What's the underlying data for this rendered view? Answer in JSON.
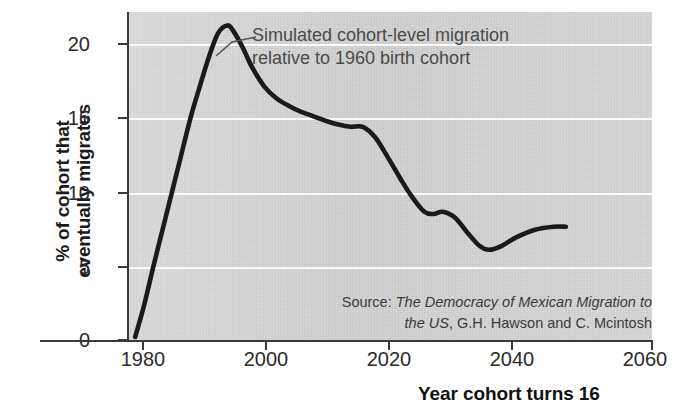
{
  "chart_data": {
    "type": "line",
    "title": "",
    "subtitle": "",
    "xlabel": "Year cohort turns 16",
    "ylabel": "% of cohort that\neventually migrates",
    "xlim": [
      1975,
      2060
    ],
    "ylim": [
      0,
      22
    ],
    "xticks": [
      "1980",
      "2000",
      "2020",
      "2040",
      "2060"
    ],
    "xtick_values": [
      1980,
      2000,
      2020,
      2040,
      2060
    ],
    "yticks": [
      "0",
      "5",
      "10",
      "15",
      "20"
    ],
    "ytick_values": [
      0,
      5,
      10,
      15,
      20
    ],
    "grid": "horizontal-white",
    "legend": "none",
    "series": [
      {
        "name": "Simulated cohort-level migration relative to 1960 birth cohort",
        "color": "#1a1a1a",
        "x": [
          1976.0,
          1977.5,
          1979.0,
          1981.0,
          1983.0,
          1985.0,
          1986.5,
          1988.0,
          1989.5,
          1991.0,
          1992.0,
          1993.5,
          1995.0,
          1997.0,
          1999.0,
          2001.0,
          2003.0,
          2005.0,
          2007.0,
          2009.0,
          2011.0,
          2013.0,
          2015.0,
          2017.0,
          2019.0,
          2021.0,
          2023.0,
          2024.5,
          2026.0,
          2028.0,
          2030.0,
          2032.0,
          2033.5,
          2035.5,
          2038.0,
          2041.0,
          2044.0,
          2046.0
        ],
        "y": [
          0.2,
          2.4,
          5.0,
          8.3,
          11.6,
          14.9,
          17.0,
          19.0,
          20.6,
          21.1,
          20.7,
          19.6,
          18.3,
          17.0,
          16.2,
          15.7,
          15.3,
          15.0,
          14.7,
          14.45,
          14.3,
          14.3,
          13.6,
          12.3,
          10.9,
          9.6,
          8.6,
          8.45,
          8.6,
          8.2,
          7.2,
          6.3,
          6.05,
          6.3,
          6.9,
          7.4,
          7.6,
          7.6
        ]
      }
    ],
    "annotations": [
      {
        "name": "curve-callout",
        "text": "Simulated cohort-level migration\nrelative to 1960 birth cohort",
        "points_to_x": 1992.5,
        "points_to_y": 20.2
      },
      {
        "name": "source-note",
        "prefix": "Source: ",
        "title_italic": "The Democracy of Mexican Migration to the US",
        "suffix": ", G.H. Hawson and C. Mcintosh"
      }
    ],
    "colors": {
      "panel_background": "#d4d4d4",
      "gridline": "#fbfbfb",
      "line": "#1a1a1a",
      "axis": "#3a3a3a",
      "tick_text": "#2b2b2b",
      "annotation_text": "#4a4a4a",
      "figure_background": "#ffffff"
    }
  }
}
